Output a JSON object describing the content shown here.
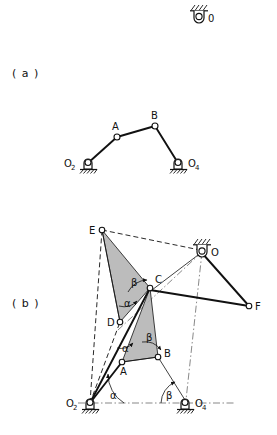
{
  "figure": {
    "background_color": "#ffffff",
    "ink_color": "#111111",
    "shade_color": "#b3b3b3",
    "part_a_label": "( a )",
    "part_b_label": "( b )"
  },
  "legend_pivot": {
    "label": "0",
    "name": "fixed-pivot-symbol"
  },
  "part_a": {
    "caption": "( a )",
    "points": [
      {
        "id": "O2",
        "label": "O",
        "sub": "2",
        "x": 88,
        "y": 163,
        "type": "ground-pivot",
        "label_side": "left"
      },
      {
        "id": "A",
        "label": "A",
        "sub": "",
        "x": 117,
        "y": 137,
        "type": "pin",
        "label_side": "above-left"
      },
      {
        "id": "B",
        "label": "B",
        "sub": "",
        "x": 155,
        "y": 126,
        "type": "pin",
        "label_side": "above"
      },
      {
        "id": "O4",
        "label": "O",
        "sub": "4",
        "x": 178,
        "y": 163,
        "type": "ground-pivot",
        "label_side": "right"
      }
    ],
    "links": [
      {
        "from": "O2",
        "to": "A",
        "style": "thick"
      },
      {
        "from": "A",
        "to": "B",
        "style": "thick"
      },
      {
        "from": "B",
        "to": "O4",
        "style": "thick"
      }
    ]
  },
  "part_b": {
    "caption": "( b )",
    "points": [
      {
        "id": "O2",
        "label": "O",
        "sub": "2",
        "x": 90,
        "y": 403,
        "type": "ground-pivot"
      },
      {
        "id": "O4",
        "label": "O",
        "sub": "4",
        "x": 185,
        "y": 403,
        "type": "ground-pivot"
      },
      {
        "id": "O",
        "label": "O",
        "sub": "",
        "x": 202,
        "y": 252,
        "type": "ground-pivot-top"
      },
      {
        "id": "A",
        "label": "A",
        "sub": "",
        "x": 122,
        "y": 362,
        "type": "pin"
      },
      {
        "id": "B",
        "label": "B",
        "sub": "",
        "x": 158,
        "y": 357,
        "type": "pin"
      },
      {
        "id": "C",
        "label": "C",
        "sub": "",
        "x": 150,
        "y": 288,
        "type": "pin"
      },
      {
        "id": "D",
        "label": "D",
        "sub": "",
        "x": 120,
        "y": 322,
        "type": "pin"
      },
      {
        "id": "E",
        "label": "E",
        "sub": "",
        "x": 102,
        "y": 230,
        "type": "pin"
      },
      {
        "id": "F",
        "label": "F",
        "sub": "",
        "x": 249,
        "y": 306,
        "type": "pin"
      }
    ],
    "shaded_triangles": [
      {
        "name": "triangle-ABC",
        "vertices": [
          "A",
          "B",
          "C"
        ]
      },
      {
        "name": "triangle-EDC",
        "vertices": [
          "E",
          "D",
          "C"
        ]
      }
    ],
    "links": [
      {
        "from": "O2",
        "to": "A",
        "style": "thick"
      },
      {
        "from": "O2",
        "to": "C",
        "style": "thick"
      },
      {
        "from": "A",
        "to": "B",
        "style": "thin"
      },
      {
        "from": "B",
        "to": "O4",
        "style": "thin"
      },
      {
        "from": "C",
        "to": "F",
        "style": "thick"
      },
      {
        "from": "O",
        "to": "F",
        "style": "thick"
      },
      {
        "from": "O2",
        "to": "D",
        "style": "dashed"
      },
      {
        "from": "O2",
        "to": "E",
        "style": "dashed"
      },
      {
        "from": "E",
        "to": "O",
        "style": "dashed"
      },
      {
        "from": "D",
        "to": "E",
        "style": "thin"
      },
      {
        "from": "O",
        "to": "C",
        "style": "thin"
      },
      {
        "from": "O",
        "to": "D",
        "style": "dashdot"
      },
      {
        "from": "O",
        "to": "O4",
        "style": "dashdot"
      },
      {
        "from": "O2",
        "to": "O4",
        "style": "dashdot"
      }
    ],
    "angles": [
      {
        "name": "angle-alpha-O2",
        "label": "α",
        "at": "O2",
        "x": 110,
        "y": 398
      },
      {
        "name": "angle-beta-O4",
        "label": "β",
        "at": "O4",
        "x": 168,
        "y": 398
      },
      {
        "name": "angle-alpha-A",
        "label": "α",
        "at": "A",
        "x": 124,
        "y": 352
      },
      {
        "name": "angle-beta-B",
        "label": "β",
        "at": "B",
        "x": 148,
        "y": 340
      },
      {
        "name": "angle-alpha-D",
        "label": "α",
        "at": "D",
        "x": 126,
        "y": 303
      },
      {
        "name": "angle-beta-C",
        "label": "β",
        "at": "C",
        "x": 132,
        "y": 283
      }
    ]
  }
}
